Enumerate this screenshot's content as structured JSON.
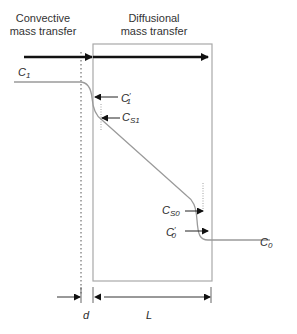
{
  "headers": {
    "convective": [
      "Convective",
      "mass transfer"
    ],
    "diffusional": [
      "Diffusional",
      "mass transfer"
    ]
  },
  "labels": {
    "C1": {
      "base": "C",
      "sub": "1"
    },
    "C1_prime": {
      "base": "C",
      "prime": "′",
      "sub": "1"
    },
    "CS1": {
      "base": "C",
      "sub": "S1"
    },
    "CS0": {
      "base": "C",
      "sub": "S0"
    },
    "C0_prime": {
      "base": "C",
      "prime": "′",
      "sub": "0"
    },
    "C0": {
      "base": "C",
      "sub": "0"
    },
    "d": "d",
    "L": "L"
  },
  "colors": {
    "profile_line": "#9a9a9a",
    "box_border": "#a8a8a8",
    "arrow": "#111111",
    "dotted_line": "#555555"
  }
}
